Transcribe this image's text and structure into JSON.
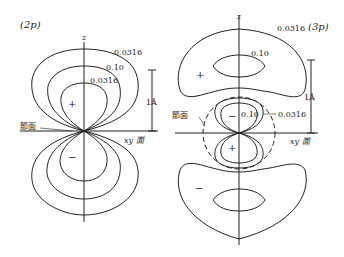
{
  "figure": {
    "panels": [
      {
        "id": "2p",
        "title": "(2p)",
        "axis_label": "z",
        "contour_labels": [
          "0.0316",
          "0.10",
          "0.0316"
        ],
        "upper_sign": "+",
        "lower_sign": "−",
        "nodal_plane_label": "節面",
        "plane_label": "xy 面",
        "scale_label": "1Å"
      },
      {
        "id": "3p",
        "title": "(3p)",
        "axis_label": "z",
        "contour_labels": [
          "0.0316",
          "0.10",
          "0.10",
          "0.0316"
        ],
        "upper_outer_sign": "+",
        "inner_upper_sign": "−",
        "inner_lower_sign": "+",
        "lower_outer_sign": "−",
        "nodal_plane_label": "節面",
        "plane_label": "xy 面",
        "scale_label": "1Å"
      }
    ]
  }
}
